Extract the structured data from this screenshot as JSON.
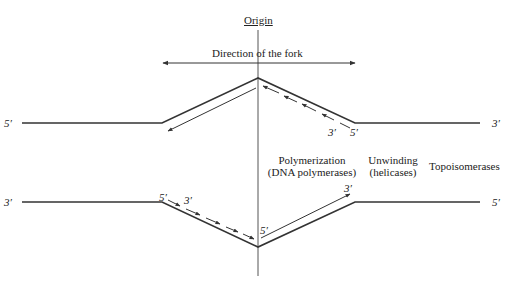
{
  "origin_label": "Origin",
  "fork_direction_label": "Direction of the fork",
  "strand_ends": {
    "top_left": "5′",
    "top_right": "3′",
    "bottom_left": "3′",
    "bottom_right": "5′"
  },
  "new_strand_labels": {
    "top_lagging_3": "3′",
    "top_lagging_5": "5′",
    "bottom_lagging_5": "5′",
    "bottom_lagging_3": "3′",
    "bottom_leading_5": "5′",
    "bottom_leading_3": "3′"
  },
  "zones": [
    {
      "line1": "Polymerization",
      "line2": "(DNA polymerases)"
    },
    {
      "line1": "Unwinding",
      "line2": "(helicases)"
    },
    {
      "line1": "Topoisomerases",
      "line2": ""
    }
  ],
  "colors": {
    "line": "#333333",
    "text": "#222222",
    "background": "#ffffff"
  }
}
